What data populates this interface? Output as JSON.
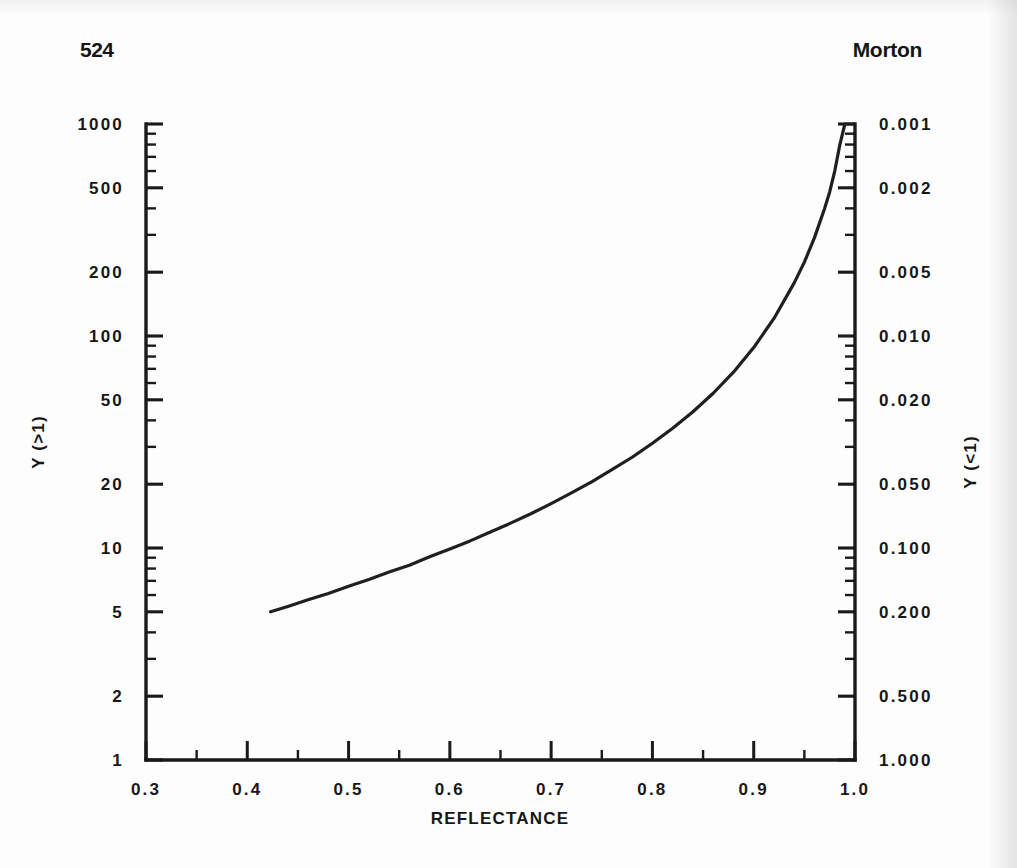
{
  "page": {
    "folio": "524",
    "running_head": "Morton",
    "background_color": "#fdfdfd",
    "ink_color": "#1a1a1a"
  },
  "chart_data": {
    "type": "line",
    "title": "",
    "xlabel": "REFLECTANCE",
    "ylabel": "Y (>1)",
    "ylabel_right": "Y (<1)",
    "xlim": [
      0.3,
      1.0
    ],
    "ylim": [
      1,
      1000
    ],
    "yscale": "log",
    "xscale": "linear",
    "grid": false,
    "legend": false,
    "xticks": [
      0.3,
      0.4,
      0.5,
      0.6,
      0.7,
      0.8,
      0.9,
      1.0
    ],
    "xtick_labels": [
      "0.3",
      "0.4",
      "0.5",
      "0.6",
      "0.7",
      "0.8",
      "0.9",
      "1.0"
    ],
    "x_minor_ticks": [
      0.35,
      0.45,
      0.55,
      0.65,
      0.75,
      0.85,
      0.95
    ],
    "yticks": [
      1000,
      500,
      200,
      100,
      50,
      20,
      10,
      5,
      2,
      1
    ],
    "ytick_labels": [
      "1000",
      "500",
      "200",
      "100",
      "50",
      "20",
      "10",
      "5",
      "2",
      "1"
    ],
    "yticks_right": [
      0.001,
      0.002,
      0.005,
      0.01,
      0.02,
      0.05,
      0.1,
      0.2,
      0.5,
      1.0
    ],
    "ytick_labels_right": [
      "0.001",
      "0.002",
      "0.005",
      "0.010",
      "0.020",
      "0.050",
      "0.100",
      "0.200",
      "0.500",
      "1.000"
    ],
    "x": [
      0.423,
      0.44,
      0.46,
      0.48,
      0.5,
      0.52,
      0.54,
      0.56,
      0.58,
      0.6,
      0.62,
      0.64,
      0.66,
      0.68,
      0.7,
      0.72,
      0.74,
      0.76,
      0.78,
      0.8,
      0.82,
      0.84,
      0.86,
      0.88,
      0.9,
      0.92,
      0.94,
      0.95,
      0.96,
      0.97,
      0.975,
      0.98,
      0.985,
      0.99,
      0.993,
      0.995,
      0.997,
      0.998
    ],
    "values": [
      5.0,
      5.3,
      5.7,
      6.1,
      6.6,
      7.1,
      7.7,
      8.3,
      9.1,
      9.9,
      10.8,
      11.9,
      13.1,
      14.5,
      16.2,
      18.2,
      20.5,
      23.4,
      26.8,
      31.2,
      36.7,
      43.9,
      53.7,
      67.5,
      88.2,
      121.0,
      178.0,
      223.0,
      291.0,
      399.0,
      478.0,
      600.0,
      797.0,
      1000.0,
      1000.0,
      1000.0,
      1000.0,
      1000.0
    ],
    "curve_equation": "Y = (1 + R) / (1 - R)",
    "series_name": "Y vs reflectance",
    "annotations": []
  }
}
